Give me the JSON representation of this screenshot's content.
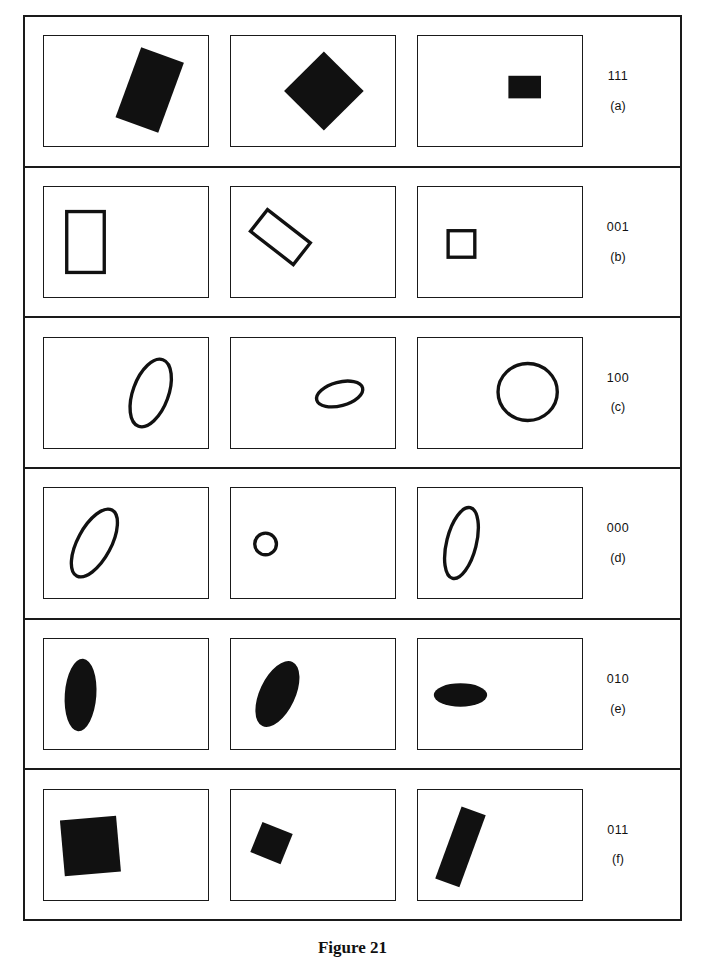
{
  "figure": {
    "caption": "Figure 21",
    "ink_color": "#111111",
    "background_color": "#ffffff",
    "rows": [
      {
        "code": "111",
        "sub": "(a)",
        "cells": [
          {
            "name": "filled-rectangle-rotated",
            "shape": "rect",
            "fill": "solid",
            "cx": 107,
            "cy": 55,
            "w": 46,
            "h": 76,
            "rotate": 20
          },
          {
            "name": "filled-square-diamond",
            "shape": "rect",
            "fill": "solid",
            "cx": 94,
            "cy": 56,
            "w": 57,
            "h": 57,
            "rotate": 45
          },
          {
            "name": "filled-rectangle-small",
            "shape": "rect",
            "fill": "solid",
            "cx": 108,
            "cy": 52,
            "w": 33,
            "h": 23,
            "rotate": 0
          }
        ]
      },
      {
        "code": "001",
        "sub": "(b)",
        "cells": [
          {
            "name": "outlined-rectangle-upright",
            "shape": "rect",
            "fill": "outline",
            "cx": 42,
            "cy": 56,
            "w": 38,
            "h": 62,
            "rotate": 0
          },
          {
            "name": "outlined-rectangle-rotated",
            "shape": "rect",
            "fill": "outline",
            "cx": 50,
            "cy": 51,
            "w": 55,
            "h": 28,
            "rotate": 38
          },
          {
            "name": "outlined-square-small",
            "shape": "rect",
            "fill": "outline",
            "cx": 44,
            "cy": 58,
            "w": 27,
            "h": 27,
            "rotate": 0
          }
        ]
      },
      {
        "code": "100",
        "sub": "(c)",
        "cells": [
          {
            "name": "outlined-ellipse-steep",
            "shape": "ellipse",
            "fill": "outline",
            "cx": 108,
            "cy": 56,
            "rx": 18,
            "ry": 36,
            "rotate": 20
          },
          {
            "name": "outlined-ellipse-flat-small",
            "shape": "ellipse",
            "fill": "outline",
            "cx": 110,
            "cy": 57,
            "rx": 24,
            "ry": 12,
            "rotate": -15
          },
          {
            "name": "outlined-circle-large",
            "shape": "ellipse",
            "fill": "outline",
            "cx": 111,
            "cy": 55,
            "rx": 30,
            "ry": 29,
            "rotate": 0
          }
        ]
      },
      {
        "code": "000",
        "sub": "(d)",
        "cells": [
          {
            "name": "outlined-ellipse-tilted-large",
            "shape": "ellipse",
            "fill": "outline",
            "cx": 51,
            "cy": 56,
            "rx": 17,
            "ry": 38,
            "rotate": 28
          },
          {
            "name": "outlined-circle-small",
            "shape": "ellipse",
            "fill": "outline",
            "cx": 35,
            "cy": 57,
            "rx": 11,
            "ry": 11,
            "rotate": 0
          },
          {
            "name": "outlined-ellipse-steep-tall",
            "shape": "ellipse",
            "fill": "outline",
            "cx": 44,
            "cy": 56,
            "rx": 15,
            "ry": 37,
            "rotate": 14
          }
        ]
      },
      {
        "code": "010",
        "sub": "(e)",
        "cells": [
          {
            "name": "filled-ellipse-vertical",
            "shape": "ellipse",
            "fill": "solid",
            "cx": 37,
            "cy": 57,
            "rx": 16,
            "ry": 37,
            "rotate": 4
          },
          {
            "name": "filled-ellipse-tilted",
            "shape": "ellipse",
            "fill": "solid",
            "cx": 47,
            "cy": 56,
            "rx": 18,
            "ry": 36,
            "rotate": 25
          },
          {
            "name": "filled-ellipse-horizontal",
            "shape": "ellipse",
            "fill": "solid",
            "cx": 43,
            "cy": 57,
            "rx": 27,
            "ry": 12,
            "rotate": 0
          }
        ]
      },
      {
        "code": "011",
        "sub": "(f)",
        "cells": [
          {
            "name": "filled-square-large",
            "shape": "rect",
            "fill": "solid",
            "cx": 47,
            "cy": 57,
            "w": 57,
            "h": 57,
            "rotate": -5
          },
          {
            "name": "filled-square-small-rotated",
            "shape": "rect",
            "fill": "solid",
            "cx": 41,
            "cy": 54,
            "w": 33,
            "h": 33,
            "rotate": 22
          },
          {
            "name": "filled-bar-rotated",
            "shape": "rect",
            "fill": "solid",
            "cx": 43,
            "cy": 58,
            "w": 26,
            "h": 78,
            "rotate": 20
          }
        ]
      }
    ]
  }
}
